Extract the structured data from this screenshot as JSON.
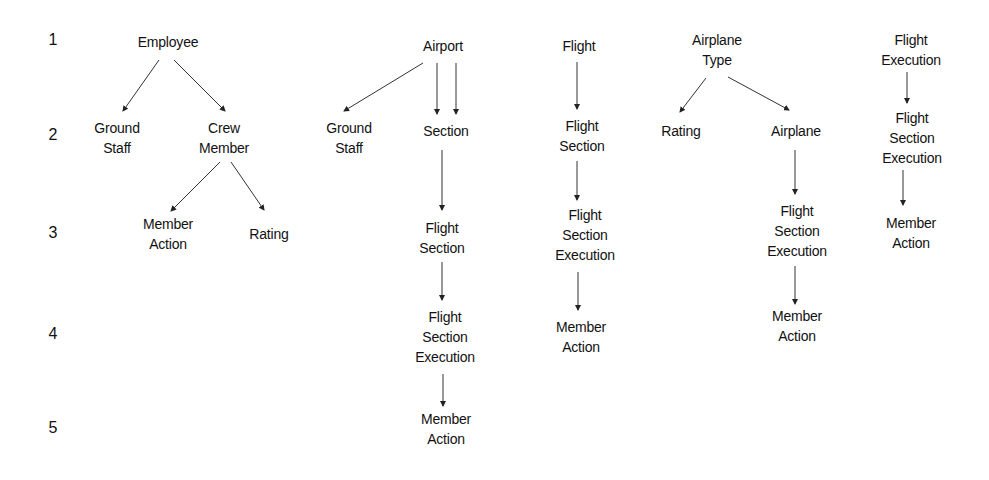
{
  "levels": [
    "1",
    "2",
    "3",
    "4",
    "5"
  ],
  "trees": [
    {
      "root": "Employee",
      "nodes": {
        "employee": [
          "Employee"
        ],
        "ground_staff": [
          "Ground",
          "Staff"
        ],
        "crew_member": [
          "Crew",
          "Member"
        ],
        "member_action": [
          "Member",
          "Action"
        ],
        "rating": [
          "Rating"
        ]
      }
    },
    {
      "root": "Airport",
      "nodes": {
        "airport": [
          "Airport"
        ],
        "ground_staff": [
          "Ground",
          "Staff"
        ],
        "section": [
          "Section"
        ],
        "flight_section": [
          "Flight",
          "Section"
        ],
        "flight_section_execution": [
          "Flight",
          "Section",
          "Execution"
        ],
        "member_action": [
          "Member",
          "Action"
        ]
      }
    },
    {
      "root": "Flight",
      "nodes": {
        "flight": [
          "Flight"
        ],
        "flight_section": [
          "Flight",
          "Section"
        ],
        "flight_section_execution": [
          "Flight",
          "Section",
          "Execution"
        ],
        "member_action": [
          "Member",
          "Action"
        ]
      }
    },
    {
      "root": "Airplane Type",
      "nodes": {
        "airplane_type": [
          "Airplane",
          "Type"
        ],
        "rating": [
          "Rating"
        ],
        "airplane": [
          "Airplane"
        ],
        "flight_section_execution": [
          "Flight",
          "Section",
          "Execution"
        ],
        "member_action": [
          "Member",
          "Action"
        ]
      }
    },
    {
      "root": "Flight Execution",
      "nodes": {
        "flight_execution": [
          "Flight",
          "Execution"
        ],
        "flight_section_execution": [
          "Flight",
          "Section",
          "Execution"
        ],
        "member_action": [
          "Member",
          "Action"
        ]
      }
    }
  ],
  "edges": [
    {
      "from": "Employee",
      "to": "Ground Staff"
    },
    {
      "from": "Employee",
      "to": "Crew Member"
    },
    {
      "from": "Crew Member",
      "to": "Member Action"
    },
    {
      "from": "Crew Member",
      "to": "Rating"
    },
    {
      "from": "Airport",
      "to": "Ground Staff"
    },
    {
      "from": "Airport",
      "to": "Section",
      "count": 2
    },
    {
      "from": "Section",
      "to": "Flight Section"
    },
    {
      "from": "Flight Section",
      "to": "Flight Section Execution"
    },
    {
      "from": "Flight Section Execution",
      "to": "Member Action"
    },
    {
      "from": "Flight",
      "to": "Flight Section"
    },
    {
      "from": "Flight Section",
      "to": "Flight Section Execution"
    },
    {
      "from": "Flight Section Execution",
      "to": "Member Action"
    },
    {
      "from": "Airplane Type",
      "to": "Rating"
    },
    {
      "from": "Airplane Type",
      "to": "Airplane"
    },
    {
      "from": "Airplane",
      "to": "Flight Section Execution"
    },
    {
      "from": "Flight Section Execution",
      "to": "Member Action"
    },
    {
      "from": "Flight Execution",
      "to": "Flight Section Execution"
    },
    {
      "from": "Flight Section Execution",
      "to": "Member Action"
    }
  ]
}
